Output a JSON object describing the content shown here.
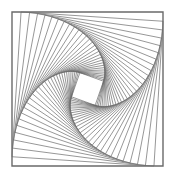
{
  "figure": {
    "type": "nested-rotating-squares",
    "outer_square": {
      "x": 12,
      "y": 12,
      "size": 151,
      "height": 154
    },
    "iterations": 30,
    "step_fraction": 0.06,
    "colors": {
      "stroke": "#6a6a6a",
      "background": "#ffffff"
    }
  }
}
